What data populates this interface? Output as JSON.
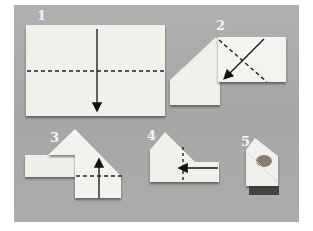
{
  "figure": {
    "background_color": "#a9a9a9",
    "napkin_color": "#f2f2ee",
    "steps": [
      {
        "number": "1",
        "instruction_glyphs": "horizontal dashed fold line, arrow pointing down"
      },
      {
        "number": "2",
        "instruction_glyphs": "diagonal dashed fold line, diagonal arrow pointing down-left"
      },
      {
        "number": "3",
        "instruction_glyphs": "horizontal dashed fold line, arrow pointing up"
      },
      {
        "number": "4",
        "instruction_glyphs": "vertical dashed fold line, arrow pointing left"
      },
      {
        "number": "5",
        "instruction_glyphs": "finished folded napkin pouch"
      }
    ]
  }
}
